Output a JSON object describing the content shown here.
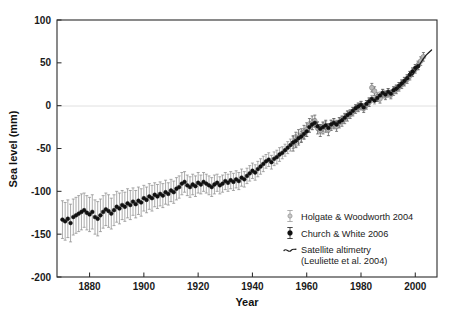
{
  "figure": {
    "title": "",
    "background_color": "#ffffff",
    "width": 453,
    "height": 319
  },
  "axes": {
    "x_title": "Year",
    "y_title": "Sea level (mm)",
    "x_ticks": [
      "1880",
      "1900",
      "1920",
      "1940",
      "1960",
      "1980",
      "2000"
    ],
    "y_ticks": [
      "100",
      "50",
      "0",
      "-50",
      "-100",
      "-150",
      "-200"
    ]
  },
  "legend": {
    "entries": [
      {
        "label": "Holgate & Woodworth 2004",
        "marker": "open-gray-circle-errorbar",
        "color": "#b9b9b9"
      },
      {
        "label": "Church & White 2006",
        "marker": "filled-black-circle-errorbar",
        "color": "#111111"
      },
      {
        "label": "Satellite altimetry",
        "marker": "wavy-line",
        "color": "#1c1c1c"
      },
      {
        "label": "(Leuliette et al. 2004)",
        "marker": "none",
        "color": "#1c1c1c"
      }
    ]
  },
  "chart_data": {
    "type": "line",
    "title": "",
    "xlabel": "Year",
    "ylabel": "Sea level (mm)",
    "xlim": [
      1868,
      2008
    ],
    "ylim": [
      -200,
      100
    ],
    "xticks": [
      1880,
      1900,
      1920,
      1940,
      1960,
      1980,
      2000
    ],
    "yticks": [
      -200,
      -150,
      -100,
      -50,
      0,
      50,
      100
    ],
    "grid": false,
    "legend_position": "lower-right-inside",
    "annotations": [
      "zero reference line at y = 0 mm"
    ],
    "series": [
      {
        "name": "Church & White 2006",
        "marker": "filled-black-circle",
        "color": "#111111",
        "has_error_bars": true,
        "error_bar_color": "#8e8e8e",
        "x": [
          1870,
          1871,
          1872,
          1873,
          1874,
          1875,
          1876,
          1877,
          1878,
          1879,
          1880,
          1881,
          1882,
          1883,
          1884,
          1885,
          1886,
          1887,
          1888,
          1889,
          1890,
          1891,
          1892,
          1893,
          1894,
          1895,
          1896,
          1897,
          1898,
          1899,
          1900,
          1901,
          1902,
          1903,
          1904,
          1905,
          1906,
          1907,
          1908,
          1909,
          1910,
          1911,
          1912,
          1913,
          1914,
          1915,
          1916,
          1917,
          1918,
          1919,
          1920,
          1921,
          1922,
          1923,
          1924,
          1925,
          1926,
          1927,
          1928,
          1929,
          1930,
          1931,
          1932,
          1933,
          1934,
          1935,
          1936,
          1937,
          1938,
          1939,
          1940,
          1941,
          1942,
          1943,
          1944,
          1945,
          1946,
          1947,
          1948,
          1949,
          1950,
          1951,
          1952,
          1953,
          1954,
          1955,
          1956,
          1957,
          1958,
          1959,
          1960,
          1961,
          1962,
          1963,
          1964,
          1965,
          1966,
          1967,
          1968,
          1969,
          1970,
          1971,
          1972,
          1973,
          1974,
          1975,
          1976,
          1977,
          1978,
          1979,
          1980,
          1981,
          1982,
          1983,
          1984,
          1985,
          1986,
          1987,
          1988,
          1989,
          1990,
          1991,
          1992,
          1993,
          1994,
          1995,
          1996,
          1997,
          1998,
          1999,
          2000,
          2001
        ],
        "y": [
          -133,
          -135,
          -132,
          -137,
          -130,
          -128,
          -126,
          -124,
          -122,
          -125,
          -127,
          -124,
          -130,
          -132,
          -128,
          -124,
          -121,
          -123,
          -126,
          -122,
          -118,
          -120,
          -116,
          -118,
          -114,
          -116,
          -112,
          -115,
          -111,
          -113,
          -108,
          -110,
          -106,
          -108,
          -104,
          -106,
          -103,
          -105,
          -101,
          -103,
          -99,
          -101,
          -97,
          -95,
          -91,
          -89,
          -93,
          -95,
          -92,
          -94,
          -90,
          -92,
          -89,
          -91,
          -93,
          -95,
          -92,
          -90,
          -93,
          -91,
          -88,
          -90,
          -87,
          -89,
          -86,
          -88,
          -84,
          -86,
          -82,
          -79,
          -76,
          -78,
          -74,
          -71,
          -68,
          -65,
          -63,
          -66,
          -62,
          -60,
          -57,
          -55,
          -52,
          -49,
          -46,
          -43,
          -41,
          -38,
          -36,
          -33,
          -30,
          -25,
          -22,
          -20,
          -24,
          -27,
          -25,
          -23,
          -26,
          -22,
          -20,
          -22,
          -19,
          -17,
          -14,
          -11,
          -9,
          -6,
          -3,
          -1,
          1,
          -2,
          2,
          5,
          8,
          6,
          9,
          12,
          15,
          13,
          16,
          14,
          18,
          20,
          23,
          26,
          29,
          32,
          36,
          40,
          44,
          46
        ],
        "y_err": [
          22,
          22,
          22,
          22,
          21,
          21,
          21,
          21,
          20,
          20,
          20,
          20,
          20,
          20,
          19,
          19,
          19,
          19,
          18,
          18,
          18,
          18,
          17,
          17,
          17,
          17,
          16,
          16,
          16,
          16,
          15,
          15,
          15,
          15,
          14,
          14,
          14,
          14,
          14,
          13,
          13,
          13,
          13,
          13,
          13,
          12,
          12,
          12,
          12,
          12,
          12,
          11,
          11,
          11,
          11,
          11,
          11,
          10,
          10,
          10,
          10,
          10,
          10,
          10,
          10,
          10,
          10,
          9,
          9,
          9,
          9,
          9,
          9,
          9,
          9,
          8,
          8,
          8,
          8,
          8,
          8,
          7,
          7,
          7,
          7,
          7,
          7,
          6,
          6,
          6,
          6,
          6,
          6,
          5,
          5,
          5,
          5,
          5,
          5,
          5,
          5,
          5,
          5,
          4,
          4,
          4,
          4,
          4,
          4,
          4,
          4,
          4,
          4,
          4,
          4,
          4,
          4,
          4,
          4,
          4,
          4,
          4,
          4,
          4,
          4,
          4,
          4,
          4,
          4,
          4,
          4,
          4
        ]
      },
      {
        "name": "Holgate & Woodworth 2004",
        "marker": "open-gray-circle",
        "color": "#b9b9b9",
        "has_error_bars": true,
        "error_bar_color": "#8e8e8e",
        "x": [
          1955,
          1956,
          1957,
          1958,
          1959,
          1960,
          1961,
          1962,
          1963,
          1964,
          1965,
          1966,
          1967,
          1968,
          1969,
          1970,
          1971,
          1972,
          1973,
          1974,
          1975,
          1976,
          1977,
          1978,
          1979,
          1980,
          1981,
          1982,
          1983,
          1984,
          1985,
          1986,
          1987,
          1988,
          1989,
          1990,
          1991,
          1992,
          1993,
          1994,
          1995,
          1996,
          1997,
          1998,
          1999,
          2000,
          2001,
          2002,
          2003
        ],
        "y": [
          -44,
          -40,
          -37,
          -35,
          -31,
          -28,
          -23,
          -20,
          -18,
          -26,
          -29,
          -26,
          -24,
          -28,
          -23,
          -21,
          -24,
          -20,
          -18,
          -15,
          -12,
          -10,
          -7,
          -4,
          -2,
          0,
          -3,
          1,
          4,
          21,
          17,
          10,
          8,
          14,
          12,
          15,
          13,
          17,
          19,
          22,
          25,
          28,
          31,
          35,
          39,
          43,
          47,
          52,
          57
        ],
        "y_err": [
          9,
          9,
          9,
          8,
          8,
          8,
          8,
          8,
          7,
          7,
          7,
          7,
          7,
          7,
          6,
          6,
          6,
          6,
          6,
          6,
          6,
          5,
          5,
          5,
          5,
          5,
          5,
          5,
          5,
          5,
          5,
          5,
          5,
          5,
          5,
          5,
          5,
          5,
          5,
          5,
          5,
          5,
          5,
          5,
          5,
          5,
          5,
          5,
          5
        ]
      },
      {
        "name": "Satellite altimetry (Leuliette et al. 2004)",
        "marker": "line",
        "color": "#1c1c1c",
        "has_error_bars": false,
        "x": [
          1993,
          1994,
          1995,
          1996,
          1997,
          1998,
          1999,
          2000,
          2001,
          2002,
          2003,
          2004,
          2005,
          2006
        ],
        "y": [
          18,
          21,
          24,
          27,
          32,
          39,
          36,
          41,
          45,
          50,
          55,
          59,
          62,
          65
        ]
      }
    ]
  }
}
